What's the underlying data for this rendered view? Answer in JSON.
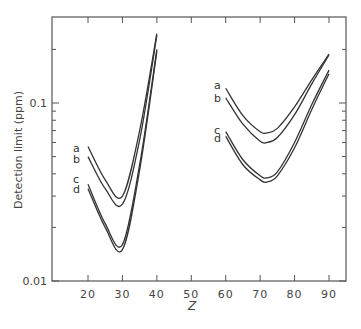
{
  "chart_data": {
    "type": "line",
    "title": "",
    "xlabel": "Z",
    "ylabel": "Detection limit (ppm)",
    "yscale": "log",
    "xlim": [
      10,
      95
    ],
    "ylim": [
      0.01,
      0.3
    ],
    "x_ticks": [
      20,
      30,
      40,
      50,
      60,
      70,
      80,
      90
    ],
    "y_tick_labels": [
      {
        "value": 0.01,
        "label": "0.01"
      },
      {
        "value": 0.1,
        "label": "0.1"
      }
    ],
    "grid": false,
    "legend": "inline curve labels a, b, c, d",
    "series": [
      {
        "name": "a",
        "group": "low-Z",
        "points": [
          [
            20,
            0.057
          ],
          [
            25,
            0.037
          ],
          [
            30,
            0.03
          ],
          [
            35,
            0.07
          ],
          [
            40,
            0.245
          ]
        ]
      },
      {
        "name": "b",
        "group": "low-Z",
        "points": [
          [
            20,
            0.05
          ],
          [
            25,
            0.033
          ],
          [
            30,
            0.027
          ],
          [
            35,
            0.062
          ],
          [
            40,
            0.24
          ]
        ]
      },
      {
        "name": "c",
        "group": "low-Z",
        "points": [
          [
            20,
            0.035
          ],
          [
            25,
            0.021
          ],
          [
            30,
            0.016
          ],
          [
            35,
            0.045
          ],
          [
            40,
            0.2
          ]
        ]
      },
      {
        "name": "d",
        "group": "low-Z",
        "points": [
          [
            20,
            0.033
          ],
          [
            25,
            0.02
          ],
          [
            30,
            0.015
          ],
          [
            35,
            0.042
          ],
          [
            40,
            0.195
          ]
        ]
      },
      {
        "name": "a",
        "group": "high-Z",
        "points": [
          [
            60,
            0.121
          ],
          [
            65,
            0.085
          ],
          [
            70,
            0.069
          ],
          [
            72,
            0.068
          ],
          [
            75,
            0.072
          ],
          [
            80,
            0.095
          ],
          [
            85,
            0.135
          ],
          [
            90,
            0.188
          ]
        ]
      },
      {
        "name": "b",
        "group": "high-Z",
        "points": [
          [
            60,
            0.107
          ],
          [
            65,
            0.076
          ],
          [
            70,
            0.061
          ],
          [
            72,
            0.06
          ],
          [
            75,
            0.064
          ],
          [
            80,
            0.086
          ],
          [
            85,
            0.128
          ],
          [
            90,
            0.186
          ]
        ]
      },
      {
        "name": "c",
        "group": "high-Z",
        "points": [
          [
            60,
            0.069
          ],
          [
            65,
            0.048
          ],
          [
            70,
            0.039
          ],
          [
            72,
            0.038
          ],
          [
            75,
            0.041
          ],
          [
            80,
            0.06
          ],
          [
            85,
            0.098
          ],
          [
            90,
            0.153
          ]
        ]
      },
      {
        "name": "d",
        "group": "high-Z",
        "points": [
          [
            60,
            0.065
          ],
          [
            65,
            0.045
          ],
          [
            70,
            0.037
          ],
          [
            72,
            0.036
          ],
          [
            75,
            0.039
          ],
          [
            80,
            0.056
          ],
          [
            85,
            0.092
          ],
          [
            90,
            0.146
          ]
        ]
      }
    ],
    "curve_labels": {
      "low": [
        {
          "text": "a",
          "x": 73,
          "y": 152
        },
        {
          "text": "b",
          "x": 73,
          "y": 163
        },
        {
          "text": "c",
          "x": 73,
          "y": 183
        },
        {
          "text": "d",
          "x": 73,
          "y": 193
        }
      ],
      "high": [
        {
          "text": "a",
          "x": 214,
          "y": 89
        },
        {
          "text": "b",
          "x": 214,
          "y": 102
        },
        {
          "text": "c",
          "x": 214,
          "y": 134
        },
        {
          "text": "d",
          "x": 214,
          "y": 142
        }
      ]
    }
  },
  "caption_fragment": "…"
}
